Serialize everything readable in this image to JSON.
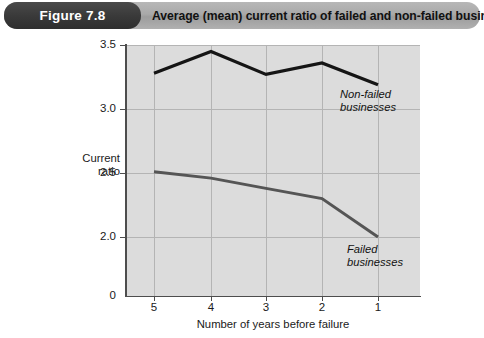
{
  "header": {
    "figure_badge": "Figure 7.8",
    "title": "Average (mean) current ratio of failed and non-failed businesses",
    "badge_color": "#333333",
    "bar_color": "#a9a9a9"
  },
  "chart_data": {
    "type": "line",
    "title": "Average (mean) current ratio of failed and non-failed businesses",
    "xlabel": "Number of years before failure",
    "ylabel": "Current ratio",
    "categories": [
      "5",
      "4",
      "3",
      "2",
      "1"
    ],
    "x_tick_labels": [
      "5",
      "4",
      "3",
      "2",
      "1"
    ],
    "y_tick_labels": [
      "3.5",
      "3.0",
      "2.5",
      "2.0",
      "0"
    ],
    "ylim": [
      2.0,
      3.5
    ],
    "y_axis_broken": true,
    "y_baseline_label": "0",
    "grid": true,
    "legend_position": "inline-annotation",
    "plot_background": "#dcdcdc",
    "series": [
      {
        "name": "Non-failed businesses",
        "color": "#151515",
        "annotation_line1": "Non-failed",
        "annotation_line2": "businesses",
        "values": [
          3.28,
          3.45,
          3.27,
          3.36,
          3.19
        ]
      },
      {
        "name": "Failed businesses",
        "color": "#555555",
        "annotation_line1": "Failed",
        "annotation_line2": "businesses",
        "values": [
          2.51,
          2.46,
          2.38,
          2.3,
          2.0
        ]
      }
    ]
  },
  "axis_label_y_line1": "Current",
  "axis_label_y_line2": "ratio"
}
